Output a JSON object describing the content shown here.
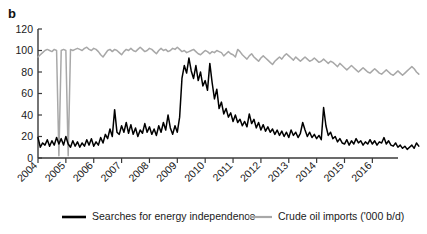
{
  "figure": {
    "panel_label": "b"
  },
  "legend": [
    {
      "label": "Searches for energy independence",
      "color": "#000000",
      "key": "searches"
    },
    {
      "label": "Crude oil imports ('000 b/d)",
      "color": "#a8a8a8",
      "key": "imports"
    }
  ],
  "chart_data": {
    "type": "line",
    "title": "",
    "subtitle": "",
    "xlabel": "",
    "ylabel": "",
    "grid": false,
    "legend_position": "bottom",
    "xlim": [
      2004.0,
      2016.92
    ],
    "ylim": [
      0,
      120
    ],
    "yticks": [
      0,
      20,
      40,
      60,
      80,
      100,
      120
    ],
    "ytick_labels": [
      "0",
      "20",
      "40",
      "60",
      "80",
      "100",
      "120"
    ],
    "xticks": [
      2004,
      2005,
      2006,
      2007,
      2008,
      2009,
      2010,
      2011,
      2012,
      2013,
      2014,
      2015,
      2016
    ],
    "xtick_labels": [
      "2004",
      "2005",
      "2006",
      "2007",
      "2008",
      "2009",
      "2010",
      "2011",
      "2012",
      "2013",
      "2014",
      "2015",
      "2016"
    ],
    "x_start": 2004.0,
    "x_step": 0.0833333,
    "series": [
      {
        "name": "Searches for energy independence",
        "color": "#000000",
        "values": [
          19,
          10,
          14,
          12,
          17,
          11,
          16,
          12,
          19,
          13,
          18,
          12,
          20,
          13,
          10,
          16,
          11,
          15,
          10,
          14,
          11,
          17,
          12,
          18,
          11,
          15,
          12,
          19,
          14,
          22,
          18,
          27,
          20,
          45,
          24,
          22,
          30,
          24,
          33,
          23,
          31,
          22,
          28,
          20,
          26,
          23,
          32,
          24,
          29,
          22,
          27,
          21,
          30,
          24,
          33,
          26,
          40,
          28,
          22,
          30,
          24,
          38,
          74,
          86,
          79,
          93,
          81,
          74,
          86,
          72,
          80,
          67,
          72,
          63,
          88,
          70,
          55,
          64,
          46,
          52,
          41,
          46,
          38,
          42,
          34,
          40,
          33,
          36,
          30,
          34,
          29,
          41,
          32,
          36,
          28,
          33,
          26,
          31,
          25,
          29,
          24,
          27,
          22,
          26,
          21,
          25,
          20,
          24,
          19,
          26,
          21,
          24,
          19,
          23,
          33,
          26,
          20,
          24,
          19,
          22,
          18,
          21,
          17,
          47,
          30,
          21,
          24,
          18,
          20,
          15,
          18,
          14,
          13,
          17,
          12,
          16,
          13,
          18,
          14,
          16,
          12,
          15,
          13,
          17,
          13,
          16,
          12,
          15,
          14,
          19,
          13,
          16,
          12,
          11,
          14,
          10,
          12,
          9,
          11,
          8,
          10,
          12,
          9,
          14,
          11
        ]
      },
      {
        "name": "Crude oil imports ('000 b/d)",
        "color": "#a8a8a8",
        "values": [
          94,
          96,
          98,
          100,
          101,
          100,
          99,
          101,
          100,
          2,
          100,
          101,
          100,
          2,
          101,
          100,
          101,
          102,
          101,
          100,
          102,
          103,
          101,
          100,
          102,
          101,
          99,
          96,
          94,
          97,
          100,
          101,
          99,
          101,
          100,
          98,
          96,
          99,
          101,
          100,
          102,
          100,
          99,
          101,
          103,
          101,
          99,
          100,
          102,
          101,
          99,
          97,
          100,
          102,
          100,
          101,
          99,
          100,
          102,
          101,
          103,
          101,
          99,
          100,
          98,
          99,
          100,
          101,
          99,
          97,
          96,
          98,
          100,
          99,
          97,
          99,
          98,
          100,
          99,
          98,
          95,
          97,
          99,
          97,
          96,
          94,
          101,
          99,
          96,
          94,
          92,
          95,
          97,
          94,
          92,
          90,
          93,
          95,
          93,
          91,
          89,
          87,
          90,
          92,
          94,
          92,
          95,
          97,
          95,
          93,
          91,
          94,
          92,
          90,
          92,
          94,
          92,
          90,
          91,
          93,
          91,
          89,
          90,
          92,
          90,
          88,
          90,
          89,
          87,
          85,
          88,
          86,
          84,
          82,
          84,
          86,
          84,
          82,
          80,
          82,
          84,
          82,
          80,
          79,
          81,
          83,
          81,
          79,
          78,
          80,
          82,
          80,
          78,
          77,
          79,
          81,
          79,
          77,
          79,
          81,
          83,
          85,
          83,
          80,
          78
        ]
      }
    ]
  }
}
